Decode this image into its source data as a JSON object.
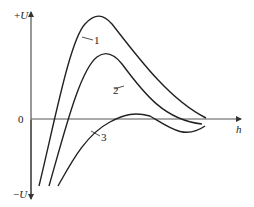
{
  "diagram": {
    "axes": {
      "y_top_label": "+U",
      "y_bottom_label": "−U",
      "origin_label": "0",
      "x_label": "h"
    },
    "curves": [
      {
        "id": "1",
        "label": "1"
      },
      {
        "id": "2",
        "label": "2"
      },
      {
        "id": "3",
        "label": "3"
      }
    ],
    "colors": {
      "line": "#222222",
      "axis": "#333333",
      "background": "#ffffff"
    }
  }
}
